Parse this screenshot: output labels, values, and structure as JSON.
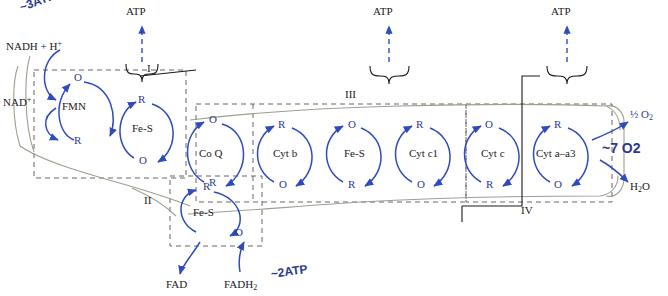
{
  "diagram": {
    "colors": {
      "ink": "#1a1a1a",
      "blue": "#2b3a8f",
      "arrow_blue": "#2f4bbf",
      "dash": "#555555"
    },
    "top_labels": [
      {
        "text": "ATP",
        "x": 134,
        "y": 10
      },
      {
        "text": "ATP",
        "x": 381,
        "y": 10
      },
      {
        "text": "ATP",
        "x": 559,
        "y": 10
      }
    ],
    "complex_labels": [
      {
        "text": "I",
        "x": 148,
        "y": 66
      },
      {
        "text": "II",
        "x": 146,
        "y": 198
      },
      {
        "text": "III",
        "x": 348,
        "y": 92
      },
      {
        "text": "IV",
        "x": 525,
        "y": 208
      }
    ],
    "carriers": [
      {
        "text": "FMN",
        "x": 75,
        "y": 106
      },
      {
        "text": "Fe-S",
        "x": 146,
        "y": 128
      },
      {
        "text": "Co Q",
        "x": 213,
        "y": 153
      },
      {
        "text": "Cyt b",
        "x": 288,
        "y": 153
      },
      {
        "text": "Fe-S",
        "x": 357,
        "y": 153
      },
      {
        "text": "Cyt c1",
        "x": 424,
        "y": 153
      },
      {
        "text": "Cyt c",
        "x": 494,
        "y": 153
      },
      {
        "text": "Cyt a–a3",
        "x": 553,
        "y": 153
      },
      {
        "text": "Fe-S",
        "x": 206,
        "y": 212
      }
    ],
    "substrate_labels": [
      {
        "text": "NADH + H",
        "sup": "+",
        "x": 8,
        "y": 44
      },
      {
        "text": "NAD",
        "sup": "+",
        "x": 5,
        "y": 100
      },
      {
        "text": "FAD",
        "x": 168,
        "y": 284
      },
      {
        "text": "FADH",
        "sub": "2",
        "x": 226,
        "y": 284
      }
    ],
    "right_labels": [
      {
        "text": "½ O2",
        "x": 631,
        "y": 114
      },
      {
        "text": "H2O",
        "x": 632,
        "y": 186
      }
    ],
    "cycle_marks": [
      {
        "text": "O",
        "x": 79,
        "y": 78
      },
      {
        "text": "R",
        "x": 79,
        "y": 140
      },
      {
        "text": "R",
        "x": 142,
        "y": 99
      },
      {
        "text": "O",
        "x": 143,
        "y": 160
      },
      {
        "text": "O",
        "x": 213,
        "y": 119
      },
      {
        "text": "R",
        "x": 213,
        "y": 182
      },
      {
        "text": "R",
        "x": 282,
        "y": 124
      },
      {
        "text": "O",
        "x": 283,
        "y": 184
      },
      {
        "text": "O",
        "x": 352,
        "y": 124
      },
      {
        "text": "R",
        "x": 352,
        "y": 184
      },
      {
        "text": "R",
        "x": 420,
        "y": 124
      },
      {
        "text": "O",
        "x": 421,
        "y": 184
      },
      {
        "text": "O",
        "x": 489,
        "y": 124
      },
      {
        "text": "R",
        "x": 490,
        "y": 184
      },
      {
        "text": "R",
        "x": 558,
        "y": 124
      },
      {
        "text": "O",
        "x": 558,
        "y": 184
      },
      {
        "text": "R",
        "x": 207,
        "y": 186
      },
      {
        "text": "O",
        "x": 239,
        "y": 232
      }
    ],
    "annotations": [
      {
        "text": "~3ATP",
        "x": 22,
        "y": 8,
        "rotate": -20
      },
      {
        "text": "~2ATP",
        "x": 272,
        "y": 272,
        "rotate": -8
      },
      {
        "text": "~7 O2",
        "x": 604,
        "y": 148,
        "rotate": 0
      }
    ]
  }
}
